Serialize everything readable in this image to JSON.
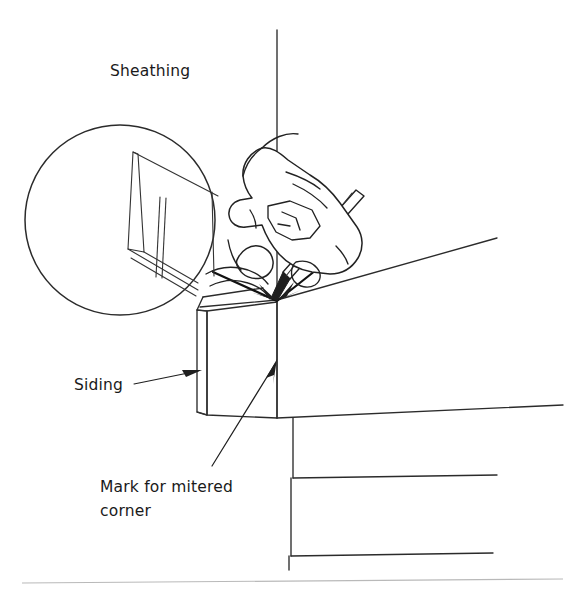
{
  "figure": {
    "width": 567,
    "height": 599,
    "background_color": "#ffffff",
    "ink_color": "#2b2b2b",
    "footer_rule_color": "#b9b9b9"
  },
  "labels": {
    "sheathing": {
      "text": "Sheathing",
      "x": 110,
      "y": 76
    },
    "siding": {
      "text": "Siding",
      "x": 74,
      "y": 390
    },
    "mark_line1": {
      "text": "Mark for mitered",
      "x": 100,
      "y": 492
    },
    "mark_line2": {
      "text": "corner",
      "x": 100,
      "y": 516
    }
  },
  "callouts": [
    {
      "name": "siding-leader",
      "label": "Siding",
      "from_x": 134,
      "from_y": 384,
      "to_x": 201,
      "to_y": 371
    },
    {
      "name": "mark-leader",
      "label": "Mark for mitered corner",
      "from_x": 212,
      "from_y": 466,
      "to_x": 277,
      "to_y": 361
    }
  ],
  "detail_inset": {
    "name": "magnified-miter-detail",
    "shape": "circle",
    "center_x": 120,
    "center_y": 220,
    "radius": 95,
    "description": "Close-up of mitered board end"
  },
  "drawing_elements": [
    {
      "name": "corner-vertical-line",
      "type": "line"
    },
    {
      "name": "sheathing-upper-edge",
      "type": "line"
    },
    {
      "name": "siding-board",
      "type": "polygon"
    },
    {
      "name": "mitered-mark-v",
      "type": "polyline"
    },
    {
      "name": "hand",
      "type": "outline"
    },
    {
      "name": "pencil",
      "type": "outline"
    },
    {
      "name": "siding-course-lines",
      "type": "lines"
    },
    {
      "name": "footer-rule",
      "type": "line"
    }
  ]
}
